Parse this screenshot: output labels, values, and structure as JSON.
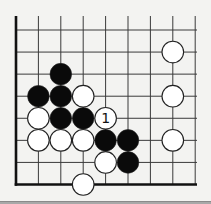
{
  "diagram": {
    "type": "go-board-fragment",
    "corner": "bottom-left",
    "columns": 9,
    "rows": 8,
    "grid": {
      "origin_x": 16,
      "origin_y": 30,
      "spacing_x": 22.4,
      "spacing_y": 22.07,
      "top_open_y": 16,
      "right_open_x": 197
    },
    "colors": {
      "background": "#f3f3f1",
      "line": "#3a3a3a",
      "edge": "#111111",
      "black_stone": "#0a0a0a",
      "white_stone": "#ffffff",
      "stone_outline": "#222222"
    },
    "stones": [
      {
        "color": "black",
        "col": 2,
        "row": 2
      },
      {
        "color": "black",
        "col": 1,
        "row": 3
      },
      {
        "color": "black",
        "col": 2,
        "row": 3
      },
      {
        "color": "white",
        "col": 3,
        "row": 3
      },
      {
        "color": "white",
        "col": 1,
        "row": 4
      },
      {
        "color": "black",
        "col": 2,
        "row": 4
      },
      {
        "color": "black",
        "col": 3,
        "row": 4
      },
      {
        "color": "white",
        "col": 4,
        "row": 4,
        "label": "1"
      },
      {
        "color": "white",
        "col": 1,
        "row": 5
      },
      {
        "color": "white",
        "col": 2,
        "row": 5
      },
      {
        "color": "white",
        "col": 3,
        "row": 5
      },
      {
        "color": "black",
        "col": 4,
        "row": 5
      },
      {
        "color": "black",
        "col": 5,
        "row": 5
      },
      {
        "color": "white",
        "col": 4,
        "row": 6
      },
      {
        "color": "black",
        "col": 5,
        "row": 6
      },
      {
        "color": "white",
        "col": 3,
        "row": 7
      },
      {
        "color": "white",
        "col": 7,
        "row": 1
      },
      {
        "color": "white",
        "col": 7,
        "row": 3
      },
      {
        "color": "white",
        "col": 7,
        "row": 5
      }
    ],
    "move_labels": [
      "1"
    ]
  }
}
